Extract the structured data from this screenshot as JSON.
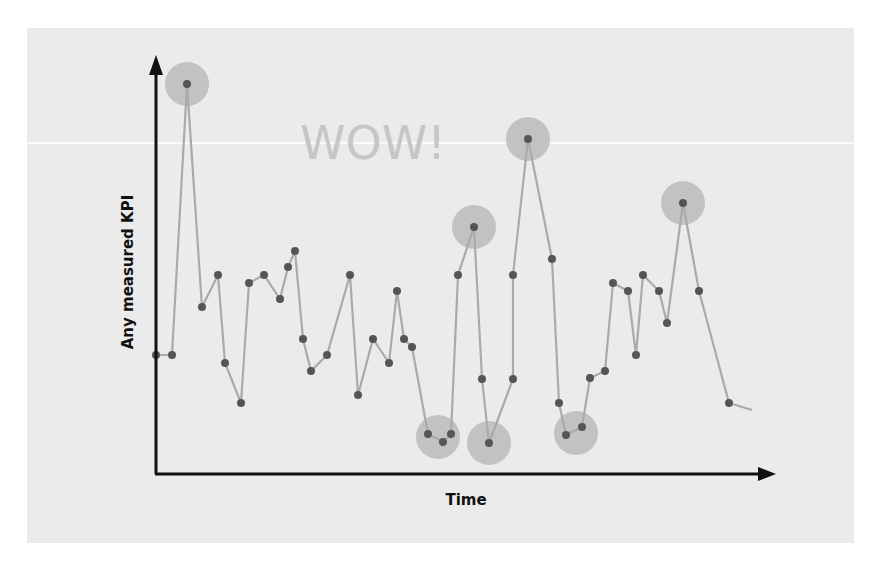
{
  "chart_data": {
    "type": "line",
    "title": "",
    "xlabel": "Time",
    "ylabel": "Any measured KPI",
    "annotations": [
      {
        "text": "WOW!",
        "note": "faint label near top highlighting outliers"
      }
    ],
    "grid": false,
    "legend": null,
    "x_ticks": [],
    "y_ticks": [],
    "points_px": [
      [
        156,
        355
      ],
      [
        172,
        355
      ],
      [
        187,
        84
      ],
      [
        202,
        307
      ],
      [
        218,
        275
      ],
      [
        225,
        363
      ],
      [
        241,
        403
      ],
      [
        249,
        283
      ],
      [
        264,
        275
      ],
      [
        280,
        299
      ],
      [
        288,
        267
      ],
      [
        295,
        251
      ],
      [
        303,
        339
      ],
      [
        311,
        371
      ],
      [
        327,
        355
      ],
      [
        350,
        275
      ],
      [
        358,
        395
      ],
      [
        373,
        339
      ],
      [
        389,
        363
      ],
      [
        397,
        291
      ],
      [
        404,
        339
      ],
      [
        412,
        347
      ],
      [
        428,
        434
      ],
      [
        443,
        442
      ],
      [
        451,
        434
      ],
      [
        458,
        275
      ],
      [
        474,
        227
      ],
      [
        482,
        379
      ],
      [
        489,
        443
      ],
      [
        513,
        379
      ],
      [
        513,
        275
      ],
      [
        528,
        139
      ],
      [
        552,
        259
      ],
      [
        559,
        403
      ],
      [
        566,
        435
      ],
      [
        582,
        427
      ],
      [
        590,
        378
      ],
      [
        605,
        371
      ],
      [
        613,
        283
      ],
      [
        628,
        291
      ],
      [
        636,
        355
      ],
      [
        643,
        275
      ],
      [
        659,
        291
      ],
      [
        667,
        323
      ],
      [
        683,
        203
      ],
      [
        699,
        291
      ],
      [
        729,
        403
      ]
    ],
    "trail_end_px": [
      752,
      410
    ],
    "values": [
      31,
      31,
      100,
      43,
      51,
      29,
      19,
      49,
      51,
      45,
      53,
      57,
      35,
      27,
      31,
      51,
      21,
      35,
      29,
      47,
      35,
      33,
      11,
      9,
      11,
      51,
      63,
      25,
      9,
      25,
      51,
      85,
      55,
      19,
      11,
      13,
      25,
      27,
      49,
      47,
      31,
      51,
      47,
      39,
      69,
      47,
      19
    ],
    "highlighted_indices": [
      2,
      22,
      23,
      24,
      26,
      28,
      31,
      34,
      35,
      44
    ],
    "highlight_halos_px": [
      [
        187,
        84
      ],
      [
        438,
        437
      ],
      [
        474,
        227
      ],
      [
        489,
        443
      ],
      [
        528,
        139
      ],
      [
        576,
        433
      ],
      [
        683,
        203
      ]
    ],
    "ylim": [
      0,
      100
    ],
    "colors": {
      "background": "#ebebeb",
      "line": "#aaaaaa",
      "point": "#555555",
      "halo": "#c2c2c2",
      "axis": "#111111",
      "annotation": "#c6c6c6"
    }
  },
  "labels": {
    "x_axis": "Time",
    "y_axis": "Any measured KPI",
    "annotation": "WOW!"
  }
}
